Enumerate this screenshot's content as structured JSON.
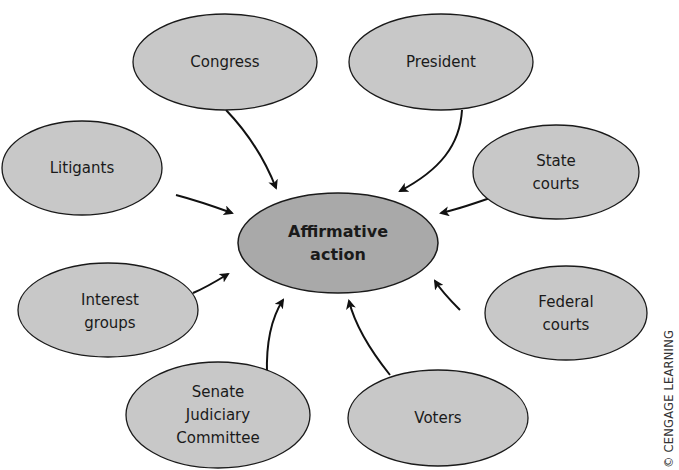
{
  "diagram": {
    "center": {
      "id": "affirmative-action",
      "lines": [
        "Affirmative",
        "action"
      ],
      "cx": 338,
      "cy": 243,
      "rx": 100,
      "ry": 50
    },
    "nodes": [
      {
        "id": "congress",
        "lines": [
          "Congress"
        ],
        "cx": 225,
        "cy": 62,
        "rx": 92,
        "ry": 48
      },
      {
        "id": "president",
        "lines": [
          "President"
        ],
        "cx": 441,
        "cy": 62,
        "rx": 92,
        "ry": 48
      },
      {
        "id": "litigants",
        "lines": [
          "Litigants"
        ],
        "cx": 82,
        "cy": 168,
        "rx": 80,
        "ry": 47
      },
      {
        "id": "state-courts",
        "lines": [
          "State",
          "courts"
        ],
        "cx": 556,
        "cy": 172,
        "rx": 83,
        "ry": 47
      },
      {
        "id": "interest-groups",
        "lines": [
          "Interest",
          "groups"
        ],
        "cx": 108,
        "cy": 310,
        "rx": 90,
        "ry": 47
      },
      {
        "id": "federal-courts",
        "lines": [
          "Federal",
          "courts"
        ],
        "cx": 566,
        "cy": 313,
        "rx": 81,
        "ry": 47
      },
      {
        "id": "senate-judiciary-committee",
        "lines": [
          "Senate",
          "Judiciary",
          "Committee"
        ],
        "cx": 218,
        "cy": 415,
        "rx": 92,
        "ry": 53
      },
      {
        "id": "voters",
        "lines": [
          "Voters"
        ],
        "cx": 438,
        "cy": 418,
        "rx": 90,
        "ry": 48
      }
    ],
    "edges": [
      {
        "from": "congress",
        "to": "affirmative-action"
      },
      {
        "from": "president",
        "to": "affirmative-action"
      },
      {
        "from": "litigants",
        "to": "affirmative-action"
      },
      {
        "from": "state-courts",
        "to": "affirmative-action"
      },
      {
        "from": "interest-groups",
        "to": "affirmative-action"
      },
      {
        "from": "federal-courts",
        "to": "affirmative-action"
      },
      {
        "from": "senate-judiciary-committee",
        "to": "affirmative-action"
      },
      {
        "from": "voters",
        "to": "affirmative-action"
      }
    ],
    "colors": {
      "outer_fill": "#c8c8c8",
      "center_fill": "#a9a9a9",
      "stroke": "#1a1a1a",
      "arrow": "#111111"
    }
  },
  "credit": "© CENGAGE LEARNING"
}
